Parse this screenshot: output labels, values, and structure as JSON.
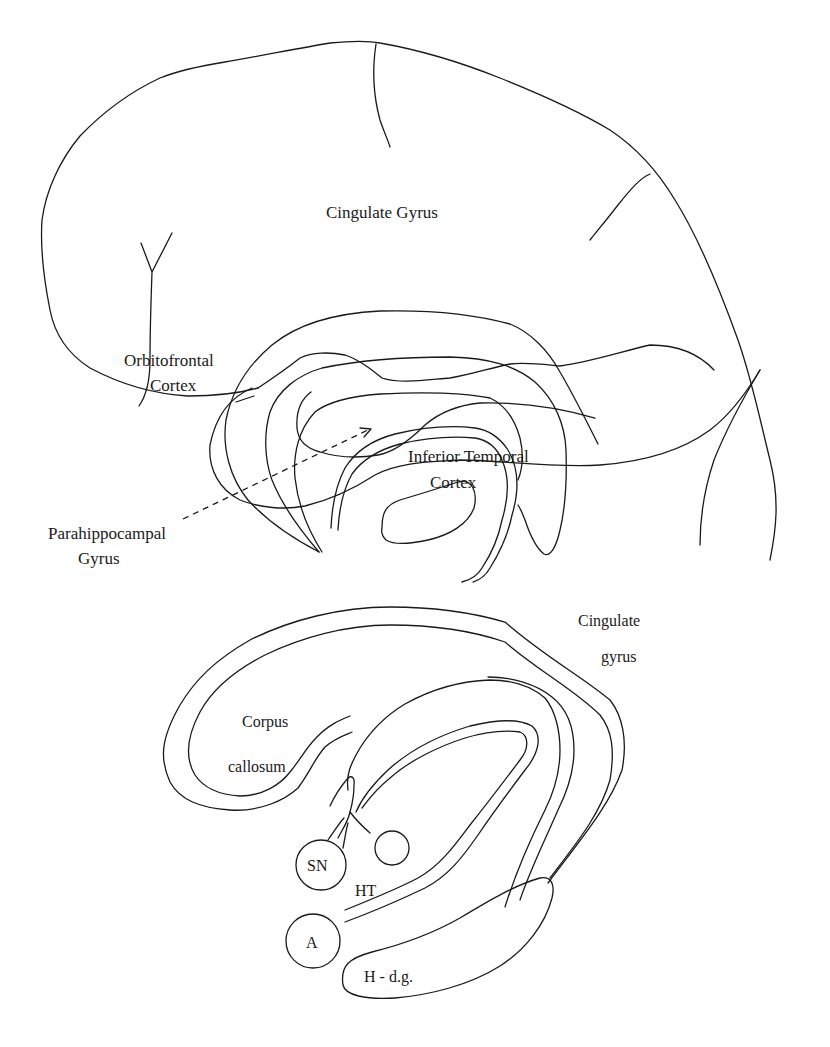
{
  "figure": {
    "top_diagram": {
      "name": "medial-brain-surface",
      "labels": {
        "cingulate_gyrus": "Cingulate Gyrus",
        "orbitofrontal_line1": "Orbitofrontal",
        "orbitofrontal_line2": "Cortex",
        "inferior_temporal_line1": "Inferior Temporal",
        "inferior_temporal_line2": "Cortex",
        "parahippocampal_line1": "Parahippocampal",
        "parahippocampal_line2": "Gyrus"
      }
    },
    "bottom_diagram": {
      "name": "limbic-circuit-schematic",
      "labels": {
        "cingulate_line1": "Cingulate",
        "cingulate_line2": "gyrus",
        "corpus_line1": "Corpus",
        "corpus_line2": "callosum",
        "sn": "SN",
        "ht": "HT",
        "a": "A",
        "hdg": "H - d.g."
      }
    },
    "colors": {
      "stroke": "#1a1a1a",
      "background": "#ffffff"
    }
  }
}
